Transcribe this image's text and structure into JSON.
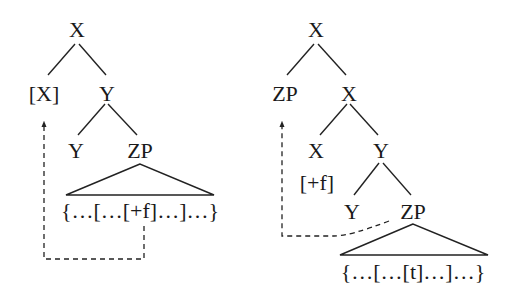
{
  "left_tree": {
    "root": "X",
    "level1": {
      "left": "[X]",
      "right": "Y"
    },
    "level2": {
      "left": "Y",
      "right": "ZP"
    },
    "terminal_string": "{…[…[+f]…]…}"
  },
  "right_tree": {
    "root": "X",
    "level1": {
      "left": "ZP",
      "right": "X"
    },
    "level2": {
      "left": "X",
      "right": "Y"
    },
    "level3": {
      "feature": "[+f]",
      "left": "Y",
      "right": "ZP"
    },
    "terminal_string": "{…[…[t]…]…}"
  },
  "colors": {
    "ink": "#1a1a1a",
    "background": "#ffffff"
  }
}
